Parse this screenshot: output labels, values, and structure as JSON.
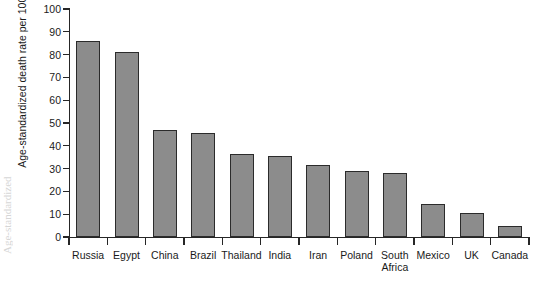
{
  "figure": {
    "background": "#ffffff",
    "bar_fill": "#8c8c8c",
    "bar_stroke": "#2b2b2b",
    "axis_color": "#262626",
    "text_color": "#1a1a1a",
    "scan_artifact_text": "Age-standardized"
  },
  "chart_data": {
    "type": "bar",
    "title": "",
    "xlabel": "",
    "ylabel": "Age-standardized death rate per 100,000",
    "ylim": [
      0,
      100
    ],
    "yticks": [
      0,
      10,
      20,
      30,
      40,
      50,
      60,
      70,
      80,
      90,
      100
    ],
    "ytick_labels": [
      "0",
      "10",
      "20",
      "30",
      "40",
      "50",
      "60",
      "70",
      "80",
      "90",
      "100"
    ],
    "grid": false,
    "legend": null,
    "categories": [
      "Russia",
      "Egypt",
      "China",
      "Brazil",
      "Thailand",
      "India",
      "Iran",
      "Poland",
      "South\nAfrica",
      "Mexico",
      "UK",
      "Canada"
    ],
    "values": [
      86,
      81,
      47,
      45.5,
      36.5,
      35.5,
      31.5,
      29,
      28,
      14.5,
      10.5,
      5
    ]
  }
}
